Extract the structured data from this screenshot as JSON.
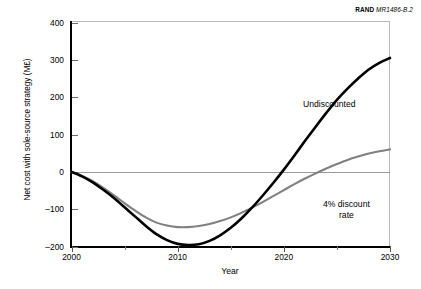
{
  "credit": {
    "organization": "RAND",
    "document_id": "MR1486-B.2"
  },
  "axes": {
    "ylabel": "Net cost with sole-source strategy (M£)",
    "xlabel": "Year",
    "yticks": [
      "400",
      "300",
      "200",
      "100",
      "0",
      "–100",
      "–200"
    ],
    "xticks": [
      "2000",
      "2010",
      "2020",
      "2030"
    ]
  },
  "annotations": {
    "undiscounted": "Undiscounted",
    "discount_line1": "4% discount",
    "discount_line2": "rate"
  },
  "colors": {
    "undiscounted": "#000000",
    "discounted": "#808080",
    "axis": "#000000",
    "zeroline": "#9a9a9a",
    "background": "#ffffff"
  },
  "chart_data": {
    "type": "line",
    "title": "",
    "xlabel": "Year",
    "ylabel": "Net cost with sole-source strategy (M£)",
    "xlim": [
      2000,
      2030
    ],
    "ylim": [
      -200,
      400
    ],
    "ytick_values": [
      400,
      300,
      200,
      100,
      0,
      -100,
      -200
    ],
    "xtick_values": [
      2000,
      2010,
      2020,
      2030
    ],
    "xminor_tick_values": [
      2005,
      2015,
      2025
    ],
    "grid": false,
    "zero_reference_line": 0,
    "legend": "inline-annotations",
    "series": [
      {
        "name": "Undiscounted",
        "color": "#000000",
        "x": [
          2000,
          2001,
          2002,
          2003,
          2004,
          2005,
          2006,
          2007,
          2008,
          2009,
          2010,
          2011,
          2012,
          2013,
          2014,
          2015,
          2016,
          2017,
          2018,
          2019,
          2020,
          2021,
          2022,
          2023,
          2024,
          2025,
          2026,
          2027,
          2028,
          2029,
          2030
        ],
        "values": [
          0,
          -12,
          -28,
          -48,
          -70,
          -95,
          -120,
          -145,
          -167,
          -183,
          -193,
          -196,
          -194,
          -185,
          -170,
          -150,
          -125,
          -96,
          -64,
          -30,
          6,
          44,
          83,
          121,
          158,
          193,
          223,
          250,
          274,
          292,
          305
        ]
      },
      {
        "name": "4% discount rate",
        "color": "#808080",
        "x": [
          2000,
          2001,
          2002,
          2003,
          2004,
          2005,
          2006,
          2007,
          2008,
          2009,
          2010,
          2011,
          2012,
          2013,
          2014,
          2015,
          2016,
          2017,
          2018,
          2019,
          2020,
          2021,
          2022,
          2023,
          2024,
          2025,
          2026,
          2027,
          2028,
          2029,
          2030
        ],
        "values": [
          0,
          -11,
          -25,
          -43,
          -63,
          -84,
          -104,
          -122,
          -136,
          -144,
          -148,
          -148,
          -145,
          -140,
          -132,
          -122,
          -110,
          -96,
          -81,
          -65,
          -49,
          -33,
          -18,
          -4,
          9,
          21,
          32,
          41,
          49,
          55,
          60
        ]
      }
    ],
    "notable_points": {
      "undiscounted_minimum": {
        "year": 2011,
        "value": -196
      },
      "discounted_minimum": {
        "year": 2011,
        "value": -148
      },
      "undiscounted_zero_crossing": 2019.8,
      "discounted_zero_crossing": 2023.6,
      "series_crossover": {
        "year": 2022,
        "value": -18
      }
    }
  }
}
